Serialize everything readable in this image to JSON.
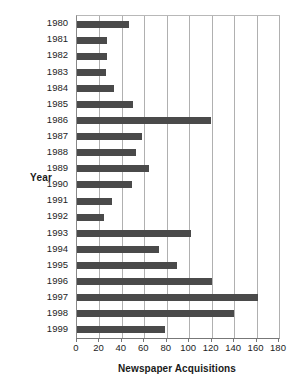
{
  "chart_data": {
    "type": "bar",
    "orientation": "horizontal",
    "title": "",
    "xlabel": "Newspaper Acquisitions",
    "ylabel": "Year",
    "xlim": [
      0,
      180
    ],
    "ylim": null,
    "grid": true,
    "legend": null,
    "bar_color": "#4a4a4a",
    "xticks": [
      0,
      20,
      40,
      60,
      80,
      100,
      120,
      140,
      160,
      180
    ],
    "xtick_labels": [
      "0",
      "20",
      "40",
      "60",
      "80",
      "100",
      "120",
      "140",
      "160",
      "180"
    ],
    "categories": [
      "1980",
      "1981",
      "1982",
      "1983",
      "1984",
      "1985",
      "1986",
      "1987",
      "1988",
      "1989",
      "1990",
      "1991",
      "1992",
      "1993",
      "1994",
      "1995",
      "1996",
      "1997",
      "1998",
      "1999"
    ],
    "values": [
      46,
      27,
      27,
      26,
      33,
      50,
      119,
      58,
      53,
      64,
      49,
      31,
      24,
      102,
      73,
      89,
      120,
      161,
      140,
      78
    ],
    "series": [
      {
        "name": "Newspaper Acquisitions",
        "values": [
          46,
          27,
          27,
          26,
          33,
          50,
          119,
          58,
          53,
          64,
          49,
          31,
          24,
          102,
          73,
          89,
          120,
          161,
          140,
          78
        ]
      }
    ]
  }
}
